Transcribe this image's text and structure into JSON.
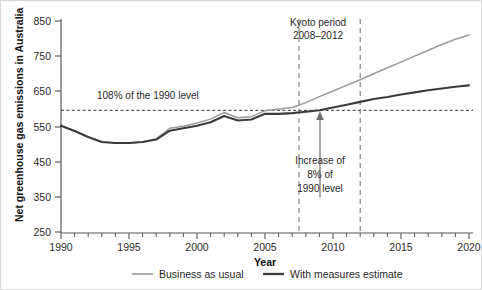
{
  "chart_data": {
    "type": "line",
    "title": "",
    "xlabel": "Year",
    "ylabel": "Net greenhouse gas emissions in Australia",
    "xlim": [
      1990,
      2020
    ],
    "ylim": [
      250,
      850
    ],
    "xticks": [
      1990,
      1995,
      2000,
      2005,
      2010,
      2015,
      2020
    ],
    "xtick_labels": [
      "1990",
      "1995",
      "2000",
      "2005",
      "2010",
      "2015",
      "2020"
    ],
    "xminor_step": 1,
    "yticks": [
      250,
      350,
      450,
      550,
      650,
      750,
      850
    ],
    "ytick_labels": [
      "250",
      "350",
      "450",
      "550",
      "650",
      "750",
      "850"
    ],
    "grid": false,
    "legend_position": "bottom",
    "x": [
      1990,
      1991,
      1992,
      1993,
      1994,
      1995,
      1996,
      1997,
      1998,
      1999,
      2000,
      2001,
      2002,
      2003,
      2004,
      2005,
      2006,
      2007,
      2008,
      2009,
      2010,
      2011,
      2012,
      2013,
      2014,
      2015,
      2016,
      2017,
      2018,
      2019,
      2020
    ],
    "series": [
      {
        "name": "Business as usual",
        "color": "#9a9a9a",
        "values": [
          552,
          537,
          520,
          506,
          503,
          503,
          506,
          515,
          545,
          551,
          560,
          571,
          590,
          575,
          578,
          595,
          600,
          604,
          618,
          635,
          651,
          667,
          683,
          700,
          717,
          733,
          750,
          767,
          783,
          798,
          810
        ]
      },
      {
        "name": "With measures estimate",
        "color": "#3c3c3c",
        "values": [
          552,
          537,
          520,
          506,
          503,
          503,
          506,
          513,
          538,
          545,
          552,
          562,
          580,
          567,
          570,
          586,
          586,
          588,
          592,
          596,
          604,
          612,
          620,
          628,
          634,
          641,
          647,
          653,
          658,
          663,
          667
        ]
      }
    ],
    "reference_lines": [
      {
        "name": "108% of the 1990 level",
        "orientation": "horizontal",
        "value": 596,
        "label": "108% of the 1990 level",
        "style": "dashed"
      },
      {
        "name": "kyoto-start",
        "orientation": "vertical",
        "value": 2007.5,
        "style": "dashed"
      },
      {
        "name": "kyoto-end",
        "orientation": "vertical",
        "value": 2012.0,
        "style": "dashed"
      }
    ],
    "annotations": [
      {
        "name": "kyoto-period",
        "lines": [
          "Kyoto period",
          "2008–2012"
        ],
        "x": 2009.5,
        "y": 800
      },
      {
        "name": "increase-callout",
        "lines": [
          "Increase of",
          "8% of",
          "1990 level"
        ],
        "x": 2009.7,
        "y": 430,
        "arrow_to_x": 2009.7,
        "arrow_to_y": 592
      }
    ]
  },
  "axes": {
    "y_title": "Net greenhouse gas emissions in Australia",
    "x_title": "Year"
  },
  "legend": {
    "items": [
      {
        "label": "Business as usual",
        "color": "#9a9a9a"
      },
      {
        "label": "With measures estimate",
        "color": "#3c3c3c"
      }
    ]
  },
  "annotation_text": {
    "reference_label": "108% of the 1990 level",
    "kyoto_line1": "Kyoto period",
    "kyoto_line2": "2008–2012",
    "increase_line1": "Increase of",
    "increase_line2": "8% of",
    "increase_line3": "1990 level"
  },
  "ytick_labels": [
    "850",
    "750",
    "650",
    "550",
    "450",
    "350",
    "250"
  ],
  "xtick_labels": [
    "1990",
    "1995",
    "2000",
    "2005",
    "2010",
    "2015",
    "2020"
  ]
}
